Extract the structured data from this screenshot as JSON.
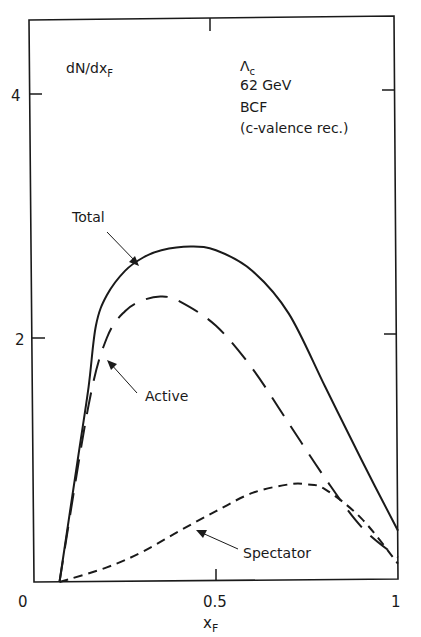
{
  "chart_data": {
    "type": "line",
    "title": "",
    "xlabel": "xF",
    "ylabel": "dN/dxF",
    "xlim": [
      0,
      1
    ],
    "ylim": [
      0,
      4.6
    ],
    "grid": false,
    "x_ticks": [
      0,
      0.5,
      1
    ],
    "x_tick_labels": [
      "0",
      "0.5",
      "1"
    ],
    "y_ticks": [
      2,
      4
    ],
    "y_tick_labels": [
      "2",
      "4"
    ],
    "annotation_block": [
      "Λc",
      "62 GeV",
      "BCF",
      "(c-valence rec.)"
    ],
    "series": [
      {
        "name": "Total",
        "style": "solid",
        "x": [
          0.07,
          0.12,
          0.15,
          0.17,
          0.2,
          0.25,
          0.3,
          0.35,
          0.43,
          0.5,
          0.6,
          0.7,
          0.8,
          0.9,
          1.0
        ],
        "values": [
          0,
          1.0,
          1.6,
          2.1,
          2.35,
          2.55,
          2.66,
          2.72,
          2.75,
          2.72,
          2.55,
          2.2,
          1.6,
          1.0,
          0.42
        ]
      },
      {
        "name": "Active",
        "style": "long-dash",
        "x": [
          0.07,
          0.15,
          0.2,
          0.25,
          0.3,
          0.35,
          0.4,
          0.5,
          0.6,
          0.7,
          0.8,
          0.9,
          1.0
        ],
        "values": [
          0,
          1.45,
          2.0,
          2.22,
          2.31,
          2.34,
          2.3,
          2.1,
          1.75,
          1.3,
          0.85,
          0.45,
          0.2
        ]
      },
      {
        "name": "Spectator",
        "style": "short-dash",
        "x": [
          0.07,
          0.2,
          0.3,
          0.4,
          0.5,
          0.6,
          0.7,
          0.75,
          0.8,
          0.9,
          1.0
        ],
        "values": [
          0,
          0.12,
          0.25,
          0.42,
          0.58,
          0.73,
          0.8,
          0.8,
          0.76,
          0.52,
          0.15
        ]
      }
    ],
    "labels": {
      "total": "Total",
      "active": "Active",
      "spectator": "Spectator"
    }
  },
  "text": {
    "ylabel": "dN/dx",
    "ylabel_sub": "F",
    "xlabel": "x",
    "xlabel_sub": "F",
    "lambda": "Λ",
    "lambda_sub": "c",
    "energy": "62 GeV",
    "model": "BCF",
    "note": "(c-valence rec.)",
    "tick_x0": "0",
    "tick_x05": "0.5",
    "tick_x1": "1",
    "tick_y2": "2",
    "tick_y4": "4",
    "label_total": "Total",
    "label_active": "Active",
    "label_spectator": "Spectator"
  },
  "colors": {
    "ink": "#1a1a1a",
    "background": "#ffffff"
  }
}
